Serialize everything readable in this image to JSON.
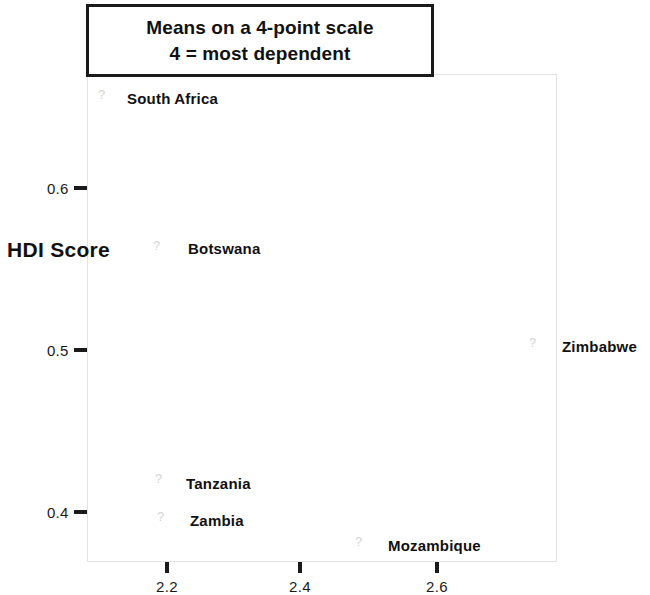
{
  "title": {
    "line1": "Means on a 4-point scale",
    "line2": "4 = most dependent"
  },
  "axes": {
    "y_title": "HDI Score",
    "y_ticks": [
      {
        "label": "0.6",
        "value": 0.6,
        "y": 188
      },
      {
        "label": "0.5",
        "value": 0.5,
        "y": 350
      },
      {
        "label": "0.4",
        "value": 0.4,
        "y": 512
      }
    ],
    "x_ticks": [
      {
        "label": "2.2",
        "value": 2.2,
        "x": 167
      },
      {
        "label": "2.4",
        "value": 2.4,
        "x": 300
      },
      {
        "label": "2.6",
        "value": 2.6,
        "x": 437
      }
    ],
    "x_title": ""
  },
  "marker_glyph": "?",
  "chart_data": {
    "type": "scatter",
    "xlabel": "",
    "ylabel": "HDI Score",
    "xlim": [
      2.13,
      2.84
    ],
    "ylim": [
      0.368,
      0.635
    ],
    "grid": false,
    "legend": "none",
    "points": [
      {
        "name": "South Africa",
        "x": 2.16,
        "y": 0.634,
        "px": 98,
        "py": 88,
        "label_px": 127,
        "label_py": 90
      },
      {
        "name": "Botswana",
        "x": 2.24,
        "y": 0.541,
        "px": 153,
        "py": 239,
        "label_px": 188,
        "label_py": 240
      },
      {
        "name": "Zimbabwe",
        "x": 2.8,
        "y": 0.482,
        "px": 529,
        "py": 336,
        "label_px": 562,
        "label_py": 338
      },
      {
        "name": "Tanzania",
        "x": 2.24,
        "y": 0.416,
        "px": 155,
        "py": 472,
        "label_px": 186,
        "label_py": 475
      },
      {
        "name": "Zambia",
        "x": 2.25,
        "y": 0.393,
        "px": 157,
        "py": 510,
        "label_px": 190,
        "label_py": 512
      },
      {
        "name": "Mozambique",
        "x": 2.55,
        "y": 0.377,
        "px": 355,
        "py": 535,
        "label_px": 388,
        "label_py": 537
      }
    ]
  }
}
